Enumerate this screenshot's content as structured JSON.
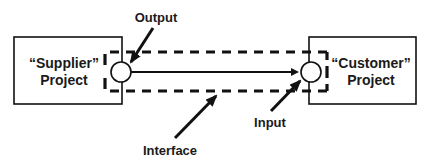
{
  "diagram": {
    "supplier_box": {
      "line1": "“Supplier”",
      "line2": "Project"
    },
    "customer_box": {
      "line1": "“Customer”",
      "line2": "Project"
    },
    "labels": {
      "output": "Output",
      "input": "Input",
      "interface": "Interface"
    },
    "colors": {
      "stroke": "#111111",
      "background": "#ffffff"
    }
  }
}
